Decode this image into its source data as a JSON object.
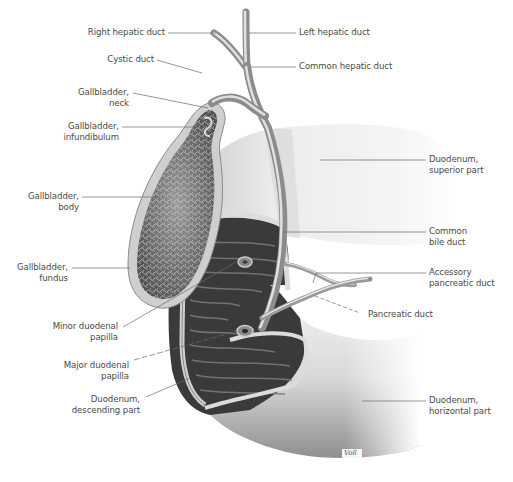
{
  "figure": {
    "type": "anatomical-illustration",
    "signature": "Voll",
    "colors": {
      "background": "#ffffff",
      "label_text": "#4a4a4a",
      "leader_line": "#6a6a6a",
      "duct_fill": "#a9a9a9",
      "duct_highlight": "#e2e2e2",
      "duodenum_light": "#efefef",
      "duodenum_shadow": "#9a9a9a",
      "mucosa_dark": "#3a3a3a",
      "gallbladder_wall": "#cfcfcf",
      "gallbladder_mucosa": "#6f6f6f"
    }
  },
  "labels": {
    "right_hepatic_duct": "Right hepatic duct",
    "left_hepatic_duct": "Left hepatic duct",
    "cystic_duct": "Cystic duct",
    "common_hepatic_duct": "Common hepatic duct",
    "gallbladder_neck": "Gallbladder,\nneck",
    "gallbladder_infundibulum": "Gallbladder,\ninfundibulum",
    "duodenum_superior": "Duodenum,\nsuperior part",
    "gallbladder_body": "Gallbladder,\nbody",
    "common_bile_duct": "Common\nbile duct",
    "gallbladder_fundus": "Gallbladder,\nfundus",
    "accessory_pancreatic_duct": "Accessory\npancreatic duct",
    "pancreatic_duct": "Pancreatic duct",
    "minor_duodenal_papilla": "Minor duodenal\npapilla",
    "major_duodenal_papilla": "Major duodenal\npapilla",
    "duodenum_descending": "Duodenum,\ndescending part",
    "duodenum_horizontal": "Duodenum,\nhorizontal part"
  }
}
